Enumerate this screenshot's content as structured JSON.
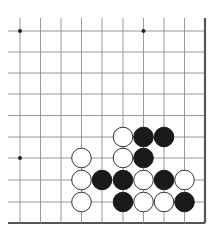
{
  "board": {
    "description": "Go board corner diagram (lower-right corner region)",
    "columns": 10,
    "rows": 10,
    "x_lines": [
      20,
      40.5,
      61,
      81.5,
      102,
      123,
      143.5,
      164,
      184.5,
      205
    ],
    "y_lines": [
      31,
      52,
      73,
      94,
      115.5,
      137,
      158,
      180,
      202,
      223
    ],
    "edges": {
      "right": true,
      "bottom": true
    },
    "line_color": "#9a9a9a",
    "edge_color": "#555555",
    "star_points": [
      {
        "col": 0,
        "row": 0
      },
      {
        "col": 6,
        "row": 0
      },
      {
        "col": 0,
        "row": 6
      }
    ],
    "stone_radius": 9.8,
    "colors": {
      "black": "#1a1a1a",
      "white": "#ffffff",
      "white_stroke": "#333333"
    },
    "stones": [
      {
        "color": "white",
        "col": 5,
        "row": 5
      },
      {
        "color": "black",
        "col": 6,
        "row": 5
      },
      {
        "color": "black",
        "col": 7,
        "row": 5
      },
      {
        "color": "white",
        "col": 3,
        "row": 6
      },
      {
        "color": "white",
        "col": 5,
        "row": 6
      },
      {
        "color": "black",
        "col": 6,
        "row": 6
      },
      {
        "color": "white",
        "col": 3,
        "row": 7
      },
      {
        "color": "black",
        "col": 4,
        "row": 7
      },
      {
        "color": "black",
        "col": 5,
        "row": 7
      },
      {
        "color": "white",
        "col": 6,
        "row": 7
      },
      {
        "color": "black",
        "col": 7,
        "row": 7
      },
      {
        "color": "white",
        "col": 8,
        "row": 7
      },
      {
        "color": "white",
        "col": 3,
        "row": 8
      },
      {
        "color": "black",
        "col": 5,
        "row": 8
      },
      {
        "color": "white",
        "col": 6,
        "row": 8
      },
      {
        "color": "white",
        "col": 7,
        "row": 8
      },
      {
        "color": "black",
        "col": 8,
        "row": 8
      }
    ]
  }
}
